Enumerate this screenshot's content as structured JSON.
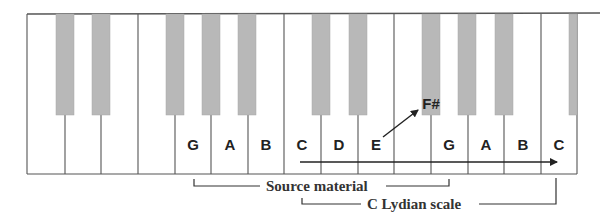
{
  "diagram": {
    "colors": {
      "background": "#ffffff",
      "white_key": "#ffffff",
      "black_key": "#b8b8b8",
      "outline": "#555555",
      "text": "#222222"
    },
    "keyboard": {
      "left": 27,
      "top": 14,
      "bottom": 174,
      "black_key_bottom": 115,
      "white_key_dividers": [
        27,
        65,
        101,
        138,
        175,
        211,
        248,
        284,
        321,
        358,
        394,
        431,
        468,
        504,
        541,
        577
      ],
      "black_keys": [
        {
          "x": 56,
          "w": 18
        },
        {
          "x": 92,
          "w": 18
        },
        {
          "x": 166,
          "w": 18
        },
        {
          "x": 202,
          "w": 18
        },
        {
          "x": 238,
          "w": 18
        },
        {
          "x": 312,
          "w": 18
        },
        {
          "x": 349,
          "w": 18
        },
        {
          "x": 422,
          "w": 18
        },
        {
          "x": 458,
          "w": 18
        },
        {
          "x": 495,
          "w": 18
        },
        {
          "x": 569,
          "w": 8
        }
      ]
    },
    "note_labels": [
      {
        "text": "G",
        "x": 178,
        "y": 137
      },
      {
        "text": "A",
        "x": 215,
        "y": 137
      },
      {
        "text": "B",
        "x": 251,
        "y": 137
      },
      {
        "text": "C",
        "x": 287,
        "y": 137
      },
      {
        "text": "D",
        "x": 324,
        "y": 137
      },
      {
        "text": "E",
        "x": 361,
        "y": 137
      },
      {
        "text": "G",
        "x": 434,
        "y": 137
      },
      {
        "text": "A",
        "x": 471,
        "y": 137
      },
      {
        "text": "B",
        "x": 508,
        "y": 137
      },
      {
        "text": "C",
        "x": 544,
        "y": 137
      }
    ],
    "raised_note": {
      "text": "F#",
      "x": 416,
      "y": 96
    },
    "raised_arrow": {
      "x1": 383,
      "y1": 137,
      "x2": 418,
      "y2": 110
    },
    "scale_arrow": {
      "x1": 300,
      "y1": 162,
      "x2": 557,
      "y2": 162
    },
    "brackets": {
      "source_material": {
        "label": "Source material",
        "left_x": 194,
        "right_x": 449,
        "top_y": 179,
        "line_y": 186,
        "label_x": 266,
        "label_y": 178
      },
      "lydian_scale": {
        "label": "C Lydian scale",
        "left_x": 302,
        "right_x": 556,
        "top_y": 178,
        "line_y": 204,
        "label_x": 367,
        "label_y": 196
      }
    }
  }
}
